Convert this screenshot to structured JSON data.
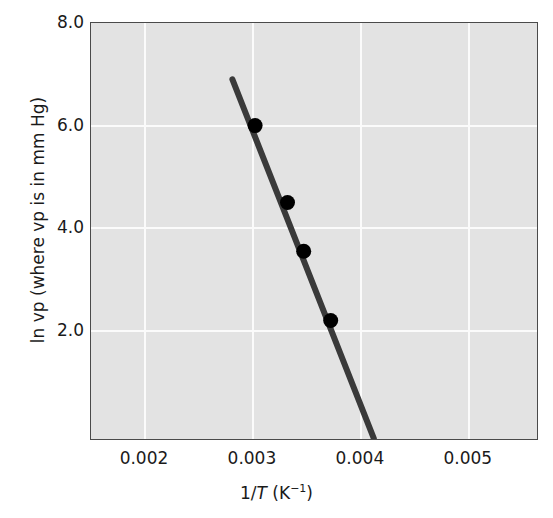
{
  "chart_data": {
    "type": "scatter",
    "title": "",
    "xlabel": "1/T (K−1)",
    "xlabel_parts": {
      "prefix": "1/",
      "italic": "T",
      "unit_open": " (K",
      "exponent": "−1",
      "unit_close": ")"
    },
    "ylabel": "ln vp (where vp is in mm Hg)",
    "xlim": [
      0.0015,
      0.00565
    ],
    "ylim": [
      -0.15,
      8.0
    ],
    "xticks": [
      0.002,
      0.003,
      0.004,
      0.005
    ],
    "xtick_labels": [
      "0.002",
      "0.003",
      "0.004",
      "0.005"
    ],
    "yticks": [
      2.0,
      4.0,
      6.0,
      8.0
    ],
    "ytick_labels": [
      "2.0",
      "4.0",
      "6.0",
      "8.0"
    ],
    "grid": true,
    "grid_color": "#fbfbfb",
    "plot_bgcolor": "#e3e3e3",
    "legend": null,
    "series": [
      {
        "name": "vapor pressure data",
        "marker": "filled-circle",
        "marker_color": "#000000",
        "x": [
          0.00302,
          0.00332,
          0.00347,
          0.00372
        ],
        "y": [
          6.0,
          4.5,
          3.55,
          2.2
        ]
      },
      {
        "name": "best-fit line",
        "type": "line",
        "line_color": "#3a3a3a",
        "x": [
          0.00281,
          0.00412
        ],
        "y": [
          6.9,
          -0.1
        ]
      }
    ]
  },
  "axes": {
    "y_label_text": "ln vp (where vp is in mm Hg)"
  }
}
